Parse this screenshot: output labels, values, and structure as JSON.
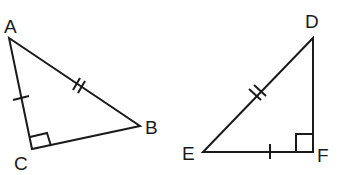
{
  "diagram": {
    "stroke_color": "#1a1a1a",
    "background": "#ffffff",
    "triangle_left": {
      "vertices": {
        "A": {
          "label": "A",
          "x": 9,
          "y": 38
        },
        "B": {
          "label": "B",
          "x": 140,
          "y": 126
        },
        "C": {
          "label": "C",
          "x": 32,
          "y": 149
        }
      },
      "right_angle_at": "C",
      "marks": {
        "AC": "single tick",
        "AB": "double tick"
      }
    },
    "triangle_right": {
      "vertices": {
        "D": {
          "label": "D",
          "x": 313,
          "y": 38
        },
        "E": {
          "label": "E",
          "x": 203,
          "y": 152
        },
        "F": {
          "label": "F",
          "x": 313,
          "y": 152
        }
      },
      "right_angle_at": "F",
      "marks": {
        "EF": "single tick",
        "DE": "double tick"
      }
    }
  }
}
